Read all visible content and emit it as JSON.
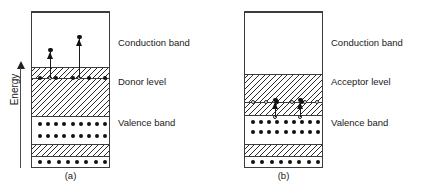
{
  "figure": {
    "axis": {
      "label": "Energy",
      "direction": "up",
      "arrow_icon": "up-arrow-icon"
    },
    "panels": [
      {
        "id": "a",
        "caption": "(a)",
        "type": "n-type",
        "labels": {
          "conduction": "Conduction band",
          "impurity": "Donor level",
          "valence": "Valence band"
        },
        "layers": [
          {
            "name": "conduction-band",
            "fill": "plain",
            "top": 0,
            "height": 55
          },
          {
            "name": "donor-upper-hatch",
            "fill": "hatch",
            "top": 55,
            "height": 11
          },
          {
            "name": "donor-level-line",
            "fill": "line",
            "top": 66,
            "height": 0
          },
          {
            "name": "donor-gap-hatch",
            "fill": "hatch",
            "top": 66,
            "height": 38
          },
          {
            "name": "valence-band",
            "fill": "plain",
            "top": 104,
            "height": 28
          },
          {
            "name": "lower-hatch",
            "fill": "hatch",
            "top": 132,
            "height": 12
          },
          {
            "name": "core-band",
            "fill": "plain",
            "top": 144,
            "height": 13
          }
        ],
        "dot_rows": [
          {
            "name": "donor-level-dots",
            "y": 66,
            "count": 5,
            "kind": "electron"
          },
          {
            "name": "valence-row-1",
            "y": 112,
            "count": 9,
            "kind": "electron"
          },
          {
            "name": "valence-row-2",
            "y": 124,
            "count": 9,
            "kind": "electron"
          },
          {
            "name": "core-row",
            "y": 150,
            "count": 8,
            "kind": "electron"
          }
        ],
        "holes": [
          {
            "name": "ionised-donor-1",
            "x": 18,
            "y": 66
          },
          {
            "name": "ionised-donor-2",
            "x": 47,
            "y": 66
          }
        ],
        "transitions": [
          {
            "name": "electron-excitation-1",
            "x": 18,
            "from_y": 66,
            "to_y": 40,
            "carrier": "electron"
          },
          {
            "name": "electron-excitation-2",
            "x": 47,
            "from_y": 66,
            "to_y": 27,
            "carrier": "electron"
          }
        ]
      },
      {
        "id": "b",
        "caption": "(b)",
        "type": "p-type",
        "labels": {
          "conduction": "Conduction band",
          "impurity": "Acceptor level",
          "valence": "Valence band"
        },
        "layers": [
          {
            "name": "conduction-band",
            "fill": "plain",
            "top": 0,
            "height": 62
          },
          {
            "name": "acceptor-gap-hatch",
            "fill": "hatch",
            "top": 62,
            "height": 28
          },
          {
            "name": "acceptor-level-line",
            "fill": "line",
            "top": 90,
            "height": 0
          },
          {
            "name": "acceptor-lower-hatch",
            "fill": "hatch",
            "top": 90,
            "height": 13
          },
          {
            "name": "valence-band",
            "fill": "plain",
            "top": 103,
            "height": 29
          },
          {
            "name": "lower-hatch",
            "fill": "hatch",
            "top": 132,
            "height": 12
          },
          {
            "name": "core-band",
            "fill": "plain",
            "top": 144,
            "height": 13
          }
        ],
        "dot_rows": [
          {
            "name": "valence-row-1",
            "y": 110,
            "count": 9,
            "kind": "electron"
          },
          {
            "name": "valence-row-2",
            "y": 120,
            "count": 9,
            "kind": "electron"
          },
          {
            "name": "core-row",
            "y": 150,
            "count": 8,
            "kind": "electron"
          }
        ],
        "acceptor_level_row": {
          "name": "acceptor-level-sites",
          "y": 90,
          "holes_x": [
            6,
            19,
            45,
            58,
            70
          ],
          "electrons_x": [
            30,
            55
          ]
        },
        "holes": [
          {
            "name": "valence-hole-1",
            "x": 30,
            "y": 105
          },
          {
            "name": "valence-hole-2",
            "x": 55,
            "y": 105
          }
        ],
        "transitions": [
          {
            "name": "hole-generation-1",
            "x": 30,
            "from_y": 105,
            "to_y": 90,
            "carrier": "hole"
          },
          {
            "name": "hole-generation-2",
            "x": 55,
            "from_y": 105,
            "to_y": 90,
            "carrier": "hole"
          }
        ]
      }
    ]
  }
}
